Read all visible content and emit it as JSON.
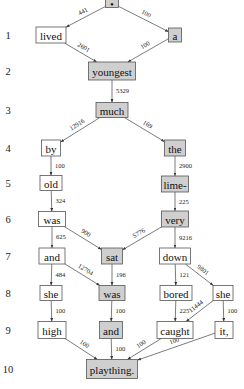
{
  "diagram": {
    "colors": {
      "highlight_fill": "#cfcfcf",
      "plain_fill": "#ffffff",
      "stroke": "#555555"
    },
    "row_labels": [
      "1",
      "2",
      "3",
      "4",
      "5",
      "6",
      "7",
      "8",
      "9",
      "10"
    ],
    "nodes": [
      {
        "id": "root",
        "text": "•",
        "highlight": true
      },
      {
        "id": "lived",
        "text": "lived",
        "highlight": false
      },
      {
        "id": "a",
        "text": "a",
        "highlight": true
      },
      {
        "id": "youngest",
        "text": "youngest",
        "highlight": true
      },
      {
        "id": "much",
        "text": "much",
        "highlight": true
      },
      {
        "id": "by",
        "text": "by",
        "highlight": false
      },
      {
        "id": "the",
        "text": "the",
        "highlight": true
      },
      {
        "id": "old",
        "text": "old",
        "highlight": false
      },
      {
        "id": "lime",
        "text": "lime-",
        "highlight": true
      },
      {
        "id": "was1",
        "text": "was",
        "highlight": false
      },
      {
        "id": "very",
        "text": "very",
        "highlight": true
      },
      {
        "id": "and1",
        "text": "and",
        "highlight": false
      },
      {
        "id": "sat",
        "text": "sat",
        "highlight": true
      },
      {
        "id": "down",
        "text": "down",
        "highlight": false
      },
      {
        "id": "she1",
        "text": "she",
        "highlight": false
      },
      {
        "id": "was2",
        "text": "was",
        "highlight": true
      },
      {
        "id": "bored",
        "text": "bored",
        "highlight": false
      },
      {
        "id": "she2",
        "text": "she",
        "highlight": false
      },
      {
        "id": "high",
        "text": "high",
        "highlight": false
      },
      {
        "id": "and2",
        "text": "and",
        "highlight": true
      },
      {
        "id": "caught",
        "text": "caught",
        "highlight": false
      },
      {
        "id": "it",
        "text": "it,",
        "highlight": false
      },
      {
        "id": "plaything",
        "text": "plaything.",
        "highlight": true
      }
    ],
    "edges": [
      {
        "from": "root",
        "to": "lived",
        "label": "441"
      },
      {
        "from": "root",
        "to": "a",
        "label": "100"
      },
      {
        "from": "lived",
        "to": "youngest",
        "label": "2601"
      },
      {
        "from": "a",
        "to": "youngest",
        "label": "100"
      },
      {
        "from": "youngest",
        "to": "much",
        "label": "5329"
      },
      {
        "from": "much",
        "to": "by",
        "label": "12916"
      },
      {
        "from": "much",
        "to": "the",
        "label": "169"
      },
      {
        "from": "by",
        "to": "old",
        "label": "100"
      },
      {
        "from": "the",
        "to": "lime",
        "label": "2900"
      },
      {
        "from": "old",
        "to": "was1",
        "label": "324"
      },
      {
        "from": "lime",
        "to": "very",
        "label": "225"
      },
      {
        "from": "was1",
        "to": "and1",
        "label": "625"
      },
      {
        "from": "was1",
        "to": "sat",
        "label": "900"
      },
      {
        "from": "very",
        "to": "sat",
        "label": "5776"
      },
      {
        "from": "very",
        "to": "down",
        "label": "9216"
      },
      {
        "from": "and1",
        "to": "she1",
        "label": "484"
      },
      {
        "from": "and1",
        "to": "was2",
        "label": "12704"
      },
      {
        "from": "sat",
        "to": "was2",
        "label": "196"
      },
      {
        "from": "down",
        "to": "bored",
        "label": "121"
      },
      {
        "from": "down",
        "to": "she2",
        "label": "9801"
      },
      {
        "from": "she1",
        "to": "high",
        "label": "100"
      },
      {
        "from": "was2",
        "to": "and2",
        "label": "100"
      },
      {
        "from": "bored",
        "to": "caught",
        "label": "225"
      },
      {
        "from": "she2",
        "to": "caught",
        "label": "11444"
      },
      {
        "from": "she2",
        "to": "it",
        "label": "100"
      },
      {
        "from": "high",
        "to": "plaything",
        "label": "100"
      },
      {
        "from": "and2",
        "to": "plaything",
        "label": "100"
      },
      {
        "from": "caught",
        "to": "plaything",
        "label": "100"
      },
      {
        "from": "it",
        "to": "plaything",
        "label": "100"
      }
    ]
  }
}
